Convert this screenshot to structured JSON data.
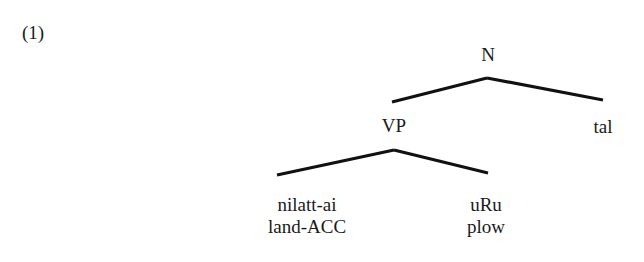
{
  "example": {
    "number": "(1)"
  },
  "tree": {
    "root": {
      "label": "N",
      "children": [
        {
          "label": "VP",
          "children": [
            {
              "word": "nilatt-ai",
              "gloss": "land-ACC"
            },
            {
              "word": "uRu",
              "gloss": "plow"
            }
          ]
        },
        {
          "label": "tal"
        }
      ]
    }
  },
  "colors": {
    "background": "#ffffff",
    "ink": "#111111"
  }
}
